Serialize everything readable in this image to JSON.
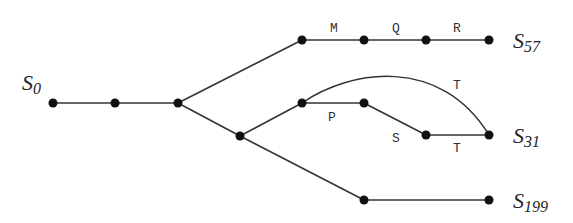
{
  "diagram": {
    "type": "tree",
    "colors": {
      "line": "#333333",
      "node": "#111111",
      "text": "#222222"
    },
    "nodes": [
      {
        "id": "n0",
        "x": 53,
        "y": 103
      },
      {
        "id": "n1",
        "x": 115,
        "y": 103
      },
      {
        "id": "n2",
        "x": 178,
        "y": 103
      },
      {
        "id": "n3",
        "x": 302,
        "y": 40
      },
      {
        "id": "n4",
        "x": 364,
        "y": 40
      },
      {
        "id": "n5",
        "x": 426,
        "y": 40
      },
      {
        "id": "n6",
        "x": 489,
        "y": 40
      },
      {
        "id": "n7",
        "x": 240,
        "y": 136
      },
      {
        "id": "n8",
        "x": 302,
        "y": 103
      },
      {
        "id": "n9",
        "x": 364,
        "y": 103
      },
      {
        "id": "n10",
        "x": 426,
        "y": 135
      },
      {
        "id": "n11",
        "x": 489,
        "y": 135
      },
      {
        "id": "n12",
        "x": 364,
        "y": 200
      },
      {
        "id": "n13",
        "x": 489,
        "y": 200
      }
    ],
    "edges": [
      {
        "from": "n0",
        "to": "n1",
        "label": ""
      },
      {
        "from": "n1",
        "to": "n2",
        "label": ""
      },
      {
        "from": "n2",
        "to": "n3",
        "label": ""
      },
      {
        "from": "n3",
        "to": "n4",
        "label": "M"
      },
      {
        "from": "n4",
        "to": "n5",
        "label": "Q"
      },
      {
        "from": "n5",
        "to": "n6",
        "label": "R"
      },
      {
        "from": "n2",
        "to": "n7",
        "label": ""
      },
      {
        "from": "n7",
        "to": "n8",
        "label": ""
      },
      {
        "from": "n8",
        "to": "n9",
        "label": "P"
      },
      {
        "from": "n9",
        "to": "n10",
        "label": "S"
      },
      {
        "from": "n10",
        "to": "n11",
        "label": "T"
      },
      {
        "from": "n8",
        "to": "n11",
        "label": "T",
        "curved": true
      },
      {
        "from": "n7",
        "to": "n12",
        "label": ""
      },
      {
        "from": "n12",
        "to": "n13",
        "label": ""
      }
    ],
    "edge_labels": {
      "m": "M",
      "q": "Q",
      "r": "R",
      "p": "P",
      "s": "S",
      "t_lower": "T",
      "t_arc": "T"
    },
    "states": {
      "s0": {
        "base": "S",
        "sub": "0"
      },
      "s57": {
        "base": "S",
        "sub": "57"
      },
      "s31": {
        "base": "S",
        "sub": "31"
      },
      "s199": {
        "base": "S",
        "sub": "199"
      }
    }
  }
}
